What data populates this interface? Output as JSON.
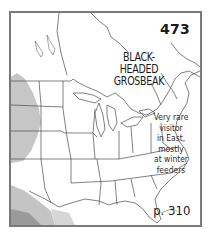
{
  "map": {
    "species_number": "473",
    "species_name_line1": "BLACK-HEADED",
    "species_name_line2": "GROSBEAK",
    "note_lines": [
      "Very rare",
      "visitor",
      "in East,",
      "mostly",
      "at winter",
      "feeders"
    ],
    "page_ref": "p. 310",
    "region": "Eastern North America (United States and southern Canada)",
    "legend_colors": {
      "range_light": "#c8c8c8",
      "range_mid": "#b0b0b0",
      "range_dark": "#8c8c8c",
      "border": "#7a7a7a",
      "state_lines": "#4a4a4a"
    }
  }
}
